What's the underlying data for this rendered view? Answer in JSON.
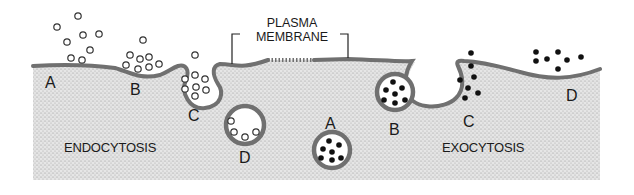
{
  "diagram": {
    "title_label": {
      "line1": "PLASMA",
      "line2": "MEMBRANE"
    },
    "regions": {
      "endocytosis": "ENDOCYTOSIS",
      "exocytosis": "EXOCYTOSIS"
    },
    "endocytosis_steps": [
      {
        "id": "A",
        "label": "A",
        "description": "Particles outside near flat membrane"
      },
      {
        "id": "B",
        "label": "B",
        "description": "Membrane invaginates around particles"
      },
      {
        "id": "C",
        "label": "C",
        "description": "Membrane pinches around particles"
      },
      {
        "id": "D",
        "label": "D",
        "description": "Vesicle with particles inside cell"
      }
    ],
    "exocytosis_steps": [
      {
        "id": "A",
        "label": "A",
        "description": "Vesicle with dark particles in cytoplasm"
      },
      {
        "id": "B",
        "label": "B",
        "description": "Vesicle approaches membrane"
      },
      {
        "id": "C",
        "label": "C",
        "description": "Vesicle fuses and opens to outside"
      },
      {
        "id": "D",
        "label": "D",
        "description": "Particles released outside cell"
      }
    ],
    "colors": {
      "membrane": "#707070",
      "cytoplasm": "#d9d9d9",
      "particle_outline": "#3a3a3a",
      "particle_fill_dark": "#111111",
      "text": "#1a1a1a"
    }
  }
}
